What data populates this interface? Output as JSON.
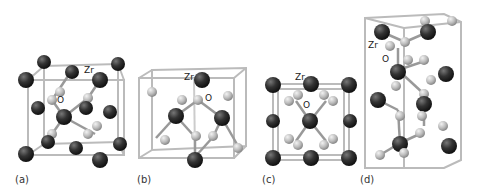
{
  "figure": {
    "panels": [
      {
        "id": "a",
        "label": "(a)",
        "zr_label": "Zr",
        "o_label": "O"
      },
      {
        "id": "b",
        "label": "(b)",
        "zr_label": "Zr",
        "o_label": "O"
      },
      {
        "id": "c",
        "label": "(c)",
        "zr_label": "Zr",
        "o_label": "O"
      },
      {
        "id": "d",
        "label": "(d)",
        "zr_label": "Zr",
        "o_label": "O"
      }
    ],
    "colors": {
      "zr_atom": "#2b2b2b",
      "o_atom": "#c4c4c4",
      "cell_edge": "#bdbdbd",
      "bond": "#9a9a9a"
    }
  }
}
